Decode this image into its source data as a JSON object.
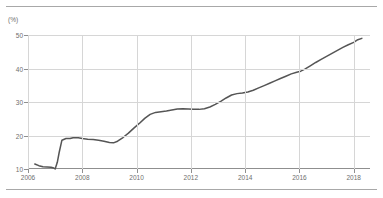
{
  "chart_data": {
    "type": "line",
    "title": "",
    "subtitle": "",
    "xlabel": "",
    "ylabel": "",
    "unit_label": "(%)",
    "ylim": [
      10,
      50
    ],
    "xlim": [
      2006,
      2018.6
    ],
    "grid": true,
    "legend": false,
    "line_color": "#555555",
    "grid_color": "#d6d6d6",
    "axis_color": "#8f8f8f",
    "text_color": "#6e6e6e",
    "y_ticks": [
      10,
      20,
      30,
      40,
      50
    ],
    "y_tick_labels": [
      "10",
      "20",
      "30",
      "40",
      "50"
    ],
    "x_ticks": [
      2006,
      2008,
      2010,
      2012,
      2014,
      2016,
      2018
    ],
    "x_tick_labels": [
      "2006",
      "2008",
      "2010",
      "2012",
      "2014",
      "2016",
      "2018"
    ],
    "series": [
      {
        "name": "share",
        "x": [
          2006.25,
          2006.4,
          2006.55,
          2006.7,
          2006.85,
          2006.95,
          2007.0,
          2007.08,
          2007.15,
          2007.25,
          2007.4,
          2007.55,
          2007.7,
          2007.85,
          2008.0,
          2008.2,
          2008.4,
          2008.6,
          2008.8,
          2009.0,
          2009.15,
          2009.3,
          2009.5,
          2009.7,
          2009.9,
          2010.1,
          2010.3,
          2010.5,
          2010.7,
          2010.9,
          2011.1,
          2011.3,
          2011.5,
          2011.7,
          2011.9,
          2012.1,
          2012.3,
          2012.5,
          2012.7,
          2012.9,
          2013.1,
          2013.3,
          2013.5,
          2013.7,
          2013.9,
          2014.1,
          2014.3,
          2014.5,
          2014.7,
          2014.9,
          2015.1,
          2015.3,
          2015.5,
          2015.7,
          2015.9,
          2016.05,
          2016.2,
          2016.4,
          2016.6,
          2016.8,
          2017.0,
          2017.2,
          2017.4,
          2017.6,
          2017.8,
          2018.0,
          2018.15,
          2018.3
        ],
        "y": [
          11.5,
          11.0,
          10.7,
          10.6,
          10.5,
          10.3,
          10.0,
          12.0,
          15.0,
          18.6,
          19.1,
          19.1,
          19.4,
          19.3,
          19.1,
          18.9,
          18.8,
          18.6,
          18.3,
          17.9,
          17.8,
          18.3,
          19.4,
          20.7,
          22.2,
          23.6,
          25.1,
          26.3,
          26.9,
          27.1,
          27.3,
          27.6,
          27.9,
          28.0,
          27.9,
          27.8,
          27.8,
          28.0,
          28.5,
          29.3,
          30.2,
          31.2,
          32.1,
          32.5,
          32.7,
          33.0,
          33.5,
          34.2,
          34.9,
          35.6,
          36.3,
          37.0,
          37.7,
          38.4,
          38.9,
          39.2,
          39.8,
          40.8,
          41.8,
          42.7,
          43.6,
          44.5,
          45.4,
          46.3,
          47.1,
          47.8,
          48.6,
          49.0
        ]
      }
    ]
  }
}
